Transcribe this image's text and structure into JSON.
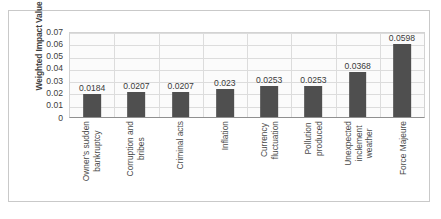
{
  "chart_data": {
    "type": "bar",
    "title": "",
    "xlabel": "",
    "ylabel": "Weighted Impact Value",
    "ylim": [
      0,
      0.07
    ],
    "grid": true,
    "legend": "none",
    "ytick_labels": [
      "0.07",
      "0.06",
      "0.05",
      "0.04",
      "0.03",
      "0.02",
      "0.01",
      "0"
    ],
    "ytick_values": [
      0.07,
      0.06,
      0.05,
      0.04,
      0.03,
      0.02,
      0.01,
      0
    ],
    "bar_color": "#4f4f4f",
    "plot_background": "#fbfbfb",
    "categories": [
      "Owner's sudden bankruptcy",
      "Corruption and bribes",
      "Criminal acts",
      "Inflation",
      "Currency fluctuation",
      "Pollution produced",
      "Unexpected inclement weather",
      "Force Majeure"
    ],
    "category_lines": [
      [
        "Owner's sudden",
        "bankruptcy"
      ],
      [
        "Corruption and",
        "bribes"
      ],
      [
        "Criminal acts"
      ],
      [
        "Inflation"
      ],
      [
        "Currency",
        "fluctuation"
      ],
      [
        "Pollution",
        "produced"
      ],
      [
        "Unexpected",
        "inclement",
        "weather"
      ],
      [
        "Force Majeure"
      ]
    ],
    "values": [
      0.0184,
      0.0207,
      0.0207,
      0.023,
      0.0253,
      0.0253,
      0.0368,
      0.0598
    ],
    "data_labels": [
      "0.0184",
      "0.0207",
      "0.0207",
      "0.023",
      "0.0253",
      "0.0253",
      "0.0368",
      "0.0598"
    ]
  }
}
